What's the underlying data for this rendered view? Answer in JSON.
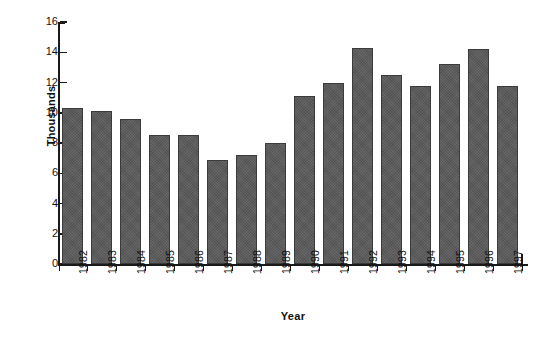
{
  "chart_data": {
    "type": "bar",
    "title": "",
    "xlabel": "Year",
    "ylabel": "Thousands",
    "categories": [
      "1982",
      "1983",
      "1984",
      "1985",
      "1986",
      "1987",
      "1988",
      "1989",
      "1990",
      "1991",
      "1992",
      "1993",
      "1994",
      "1995",
      "1996",
      "1997"
    ],
    "values": [
      10.3,
      10.1,
      9.6,
      8.5,
      8.5,
      6.9,
      7.2,
      8.0,
      11.1,
      12.0,
      14.3,
      12.5,
      11.8,
      13.2,
      14.2,
      11.8
    ],
    "ylim": [
      0,
      16
    ],
    "yticks": [
      0,
      2,
      4,
      6,
      8,
      10,
      12,
      14,
      16
    ],
    "ytick_labels": [
      "0",
      "2",
      "4",
      "6",
      "8",
      "10",
      "12",
      "14",
      "16"
    ],
    "grid": false,
    "legend": null,
    "bar_color": "#5a5a5a",
    "bar_edge_color": "#3b3b3b",
    "axis_color": "#1a1a1a",
    "background_color": "#ffffff"
  },
  "axes": {
    "y_title": "Thousands",
    "x_title": "Year"
  }
}
